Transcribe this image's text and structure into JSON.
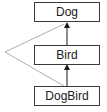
{
  "diagram": {
    "title": "",
    "nodes": [
      {
        "id": "dog",
        "label": "Dog"
      },
      {
        "id": "bird",
        "label": "Bird"
      },
      {
        "id": "dogbird",
        "label": "DogBird"
      }
    ],
    "edges": [
      {
        "from": "bird",
        "to": "dog",
        "style": "solid-arrow"
      },
      {
        "from": "dogbird",
        "to": "bird",
        "style": "solid-arrow"
      },
      {
        "from": "dogbird",
        "to": "dog",
        "style": "thin-gray-arrow-via-left-point"
      }
    ],
    "colors": {
      "box_border": "#3a3a3a",
      "arrow": "#1a1a1a",
      "indirect_line": "#9a9a9a"
    }
  }
}
